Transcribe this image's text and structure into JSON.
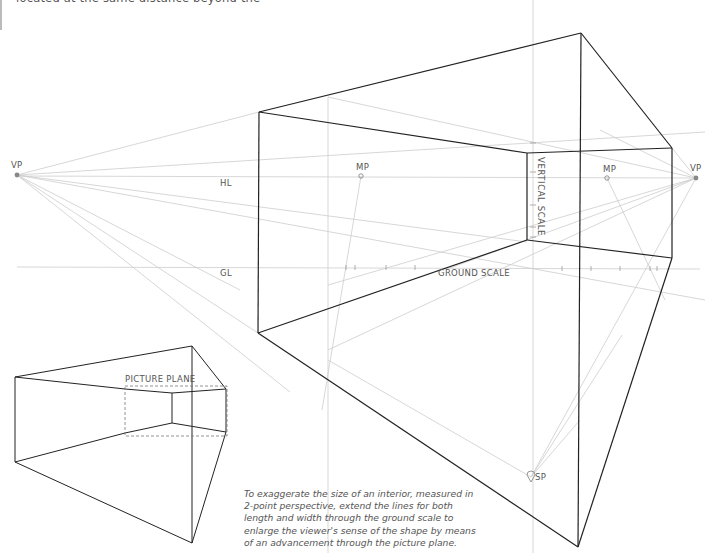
{
  "top_text": "located at the same distance beyond the",
  "labels": {
    "vp_left": "VP",
    "vp_right": "VP",
    "mp_left": "MP",
    "mp_right": "MP",
    "hl": "HL",
    "gl": "GL",
    "ground_scale": "GROUND SCALE",
    "vertical_scale": "VERTICAL SCALE",
    "sp": "SP",
    "picture_plane": "PICTURE PLANE"
  },
  "caption": "To exaggerate the size of an interior, measured in 2-point perspective, extend the lines for both length and width through the ground scale to enlarge the viewer's sense of the shape by means of an advancement through the picture plane.",
  "colors": {
    "outline": "#222222",
    "construction": "#c8c8c8",
    "text": "#555555"
  }
}
